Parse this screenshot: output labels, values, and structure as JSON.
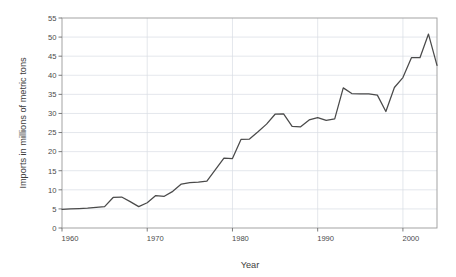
{
  "chart_data": {
    "type": "line",
    "title": "",
    "xlabel": "Year",
    "ylabel": "Imports in millions of metric tons",
    "xlim": [
      1960,
      2004
    ],
    "ylim": [
      0,
      55
    ],
    "grid": true,
    "legend": "none",
    "x_ticks": [
      1960,
      1970,
      1980,
      1990,
      2000
    ],
    "x_tick_labels": [
      "1960",
      "1970",
      "1980",
      "1990",
      "2000"
    ],
    "y_ticks": [
      0,
      5,
      10,
      15,
      20,
      25,
      30,
      35,
      40,
      45,
      50,
      55
    ],
    "y_tick_labels": [
      "0",
      "5",
      "10",
      "15",
      "20",
      "25",
      "30",
      "35",
      "40",
      "45",
      "50",
      "55"
    ],
    "series": [
      {
        "name": "Imports",
        "color": "#4a4a4a",
        "x": [
          1960,
          1961,
          1962,
          1963,
          1964,
          1965,
          1966,
          1967,
          1968,
          1969,
          1970,
          1971,
          1972,
          1973,
          1974,
          1975,
          1976,
          1977,
          1978,
          1979,
          1980,
          1981,
          1982,
          1983,
          1984,
          1985,
          1986,
          1987,
          1988,
          1989,
          1990,
          1991,
          1992,
          1993,
          1994,
          1995,
          1996,
          1997,
          1998,
          1999,
          2000,
          2001,
          2002,
          2003,
          2004
        ],
        "values": [
          4.9,
          5.0,
          5.1,
          5.2,
          5.4,
          5.6,
          8.0,
          8.1,
          6.9,
          5.6,
          6.6,
          8.5,
          8.3,
          9.6,
          11.5,
          11.9,
          12.0,
          12.3,
          15.3,
          18.3,
          18.2,
          23.2,
          23.3,
          25.2,
          27.2,
          29.8,
          29.9,
          26.6,
          26.5,
          28.3,
          28.9,
          28.2,
          28.6,
          36.7,
          35.2,
          35.1,
          35.1,
          34.8,
          30.5,
          36.8,
          39.4,
          44.6,
          44.6,
          50.8,
          42.6
        ]
      }
    ]
  },
  "axis_titles": {
    "x": "Year",
    "y": "Imports in millions of metric tons"
  }
}
